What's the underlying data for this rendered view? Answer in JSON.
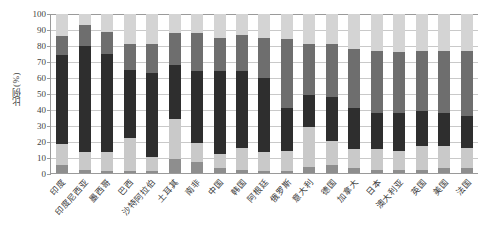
{
  "chart_data": {
    "type": "bar",
    "subtype": "stacked-bar-100",
    "title": "",
    "xlabel": "",
    "ylabel": "比例(%)",
    "ylim": [
      0,
      100
    ],
    "yticks": [
      0,
      10,
      20,
      30,
      40,
      50,
      60,
      70,
      80,
      90,
      100
    ],
    "grid": true,
    "legend": "none",
    "categories": [
      "印度",
      "印度尼西亚",
      "墨西哥",
      "巴西",
      "沙特阿拉伯",
      "土耳其",
      "南非",
      "中国",
      "韩国",
      "阿根廷",
      "俄罗斯",
      "意大利",
      "德国",
      "加拿大",
      "日本",
      "澳大利亚",
      "英国",
      "美国",
      "法国"
    ],
    "series": [
      {
        "name": "segment-1",
        "color": "#8e8e8e",
        "values": [
          5,
          2,
          1,
          1,
          1,
          9,
          7,
          3,
          2,
          1,
          1,
          4,
          5,
          3,
          2,
          2,
          2,
          3,
          3
        ]
      },
      {
        "name": "segment-2",
        "color": "#c9c9c9",
        "values": [
          13,
          11,
          12,
          21,
          9,
          25,
          12,
          9,
          14,
          12,
          13,
          25,
          15,
          12,
          13,
          12,
          15,
          14,
          13
        ]
      },
      {
        "name": "segment-3",
        "color": "#2e2e2e",
        "values": [
          56,
          67,
          62,
          43,
          53,
          34,
          45,
          52,
          48,
          47,
          27,
          20,
          28,
          26,
          23,
          24,
          22,
          21,
          20
        ]
      },
      {
        "name": "segment-4",
        "color": "#6e6e6e",
        "values": [
          12,
          13,
          14,
          16,
          18,
          20,
          24,
          21,
          23,
          25,
          43,
          32,
          33,
          37,
          39,
          38,
          38,
          39,
          41
        ]
      },
      {
        "name": "segment-5",
        "color": "#d4d4d4",
        "values": [
          14,
          7,
          11,
          19,
          19,
          12,
          12,
          15,
          13,
          15,
          16,
          19,
          19,
          22,
          23,
          24,
          23,
          23,
          23
        ]
      }
    ]
  },
  "colors": {
    "axis": "#9a9a9a",
    "grid": "#c9c9c9",
    "text": "#3f3f3f",
    "background": "#ffffff"
  }
}
